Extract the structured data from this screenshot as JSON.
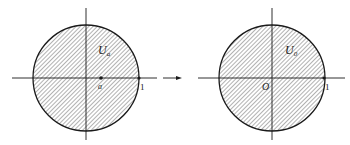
{
  "figure": {
    "left": {
      "region_label": "U",
      "region_subscript": "a",
      "point_label": "a",
      "unit_label": "1"
    },
    "arrow": "mapping-arrow",
    "right": {
      "region_label": "U",
      "region_subscript": "0",
      "origin_label": "O",
      "unit_label": "1"
    },
    "colors": {
      "line": "#1a1a1a",
      "hatch": "#555555",
      "background": "#ffffff"
    }
  }
}
